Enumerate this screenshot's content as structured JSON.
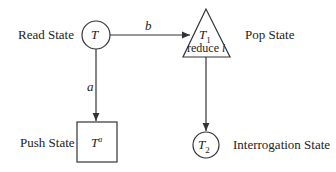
{
  "labels": {
    "read_state": "Read State",
    "pop_state": "Pop State",
    "push_state": "Push State",
    "interrogation_state": "Interrogation State"
  },
  "nodes": {
    "read": {
      "symbol": "T",
      "shape": "circle"
    },
    "pop": {
      "symbol": "T",
      "subscript": "1",
      "text": "reduce i",
      "shape": "triangle"
    },
    "push": {
      "symbol": "T",
      "superscript": "a",
      "shape": "square"
    },
    "interrogation": {
      "symbol": "T",
      "subscript": "2",
      "shape": "circle"
    }
  },
  "edges": {
    "b": "b",
    "a": "a"
  }
}
